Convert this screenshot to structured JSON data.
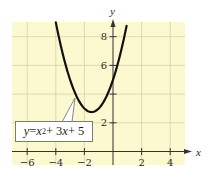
{
  "chart_data": {
    "type": "line",
    "title": "",
    "xlabel": "x",
    "ylabel": "y",
    "xlim": [
      -7,
      5
    ],
    "ylim": [
      -1,
      9
    ],
    "x_ticks": [
      -6,
      -4,
      -2,
      2,
      4
    ],
    "y_ticks": [
      2,
      6,
      8
    ],
    "y_ticks_unlabeled": [
      4
    ],
    "grid": true,
    "background_color": "#fcf8d0",
    "grid_color": "#d8d4a8",
    "series": [
      {
        "name": "y = x^2 + 3x + 5",
        "function": "x^2 + 3x + 5",
        "color": "#111111",
        "x": [
          -4.3,
          -4,
          -3.5,
          -3,
          -2.5,
          -2,
          -1.5,
          -1,
          -0.5,
          0,
          0.5,
          1,
          1.2
        ],
        "values": [
          10.59,
          9,
          7.75,
          5,
          3.75,
          3,
          2.75,
          3,
          3.75,
          5,
          6.75,
          9,
          10.04
        ]
      }
    ],
    "annotations": [
      {
        "text": "y = x² + 3x + 5",
        "points_to": [
          -2.7,
          4.2
        ]
      }
    ]
  },
  "labels": {
    "x_axis": "x",
    "y_axis": "y",
    "equation_parts": {
      "y": "y",
      "eq": " = ",
      "x1": "x",
      "exp": "2",
      "plus1": " + 3",
      "x2": "x",
      "plus2": " + 5"
    },
    "xticks": [
      "−6",
      "−4",
      "−2",
      "2",
      "4"
    ],
    "yticks": [
      "8",
      "6",
      "2"
    ]
  }
}
